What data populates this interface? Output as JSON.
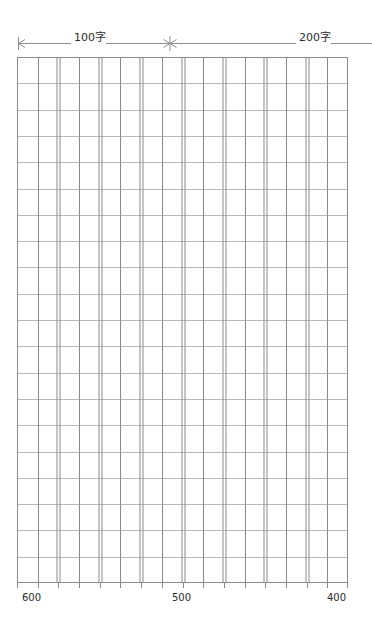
{
  "page": {
    "background_color": "#ffffff",
    "width": 372,
    "height": 634
  },
  "top_ruler": {
    "left_marker": "left-arrow-tick",
    "middle_marker": "double-arrow-tick",
    "right_marker": "line-end",
    "segments": [
      {
        "label": "100字",
        "name": "segment-100-characters"
      },
      {
        "label": "200字",
        "name": "segment-200-characters"
      }
    ],
    "line_color": "#8f8f8f"
  },
  "grid": {
    "columns": 16,
    "rows": 20,
    "column_pairs": 8,
    "cell_width": 20.7,
    "cell_height": 26.3,
    "thin_line_color": "#b9b9b9",
    "thick_line_color": "#8a8a8a",
    "border_color": "#8a8a8a",
    "fill_color": "#ffffff"
  },
  "bottom_scale": {
    "labels": [
      {
        "text": "600",
        "name": "scale-label-600"
      },
      {
        "text": "500",
        "name": "scale-label-500"
      },
      {
        "text": "400",
        "name": "scale-label-400"
      }
    ],
    "tick_color": "#8a8a8a"
  },
  "chart_data": {
    "type": "table",
    "xlabel": "",
    "ylabel": "",
    "categories": [
      "600",
      "500",
      "400"
    ],
    "values": [
      600,
      500,
      400
    ],
    "annotations": [
      "100字",
      "200字"
    ],
    "grid": true,
    "legend_position": "none"
  }
}
